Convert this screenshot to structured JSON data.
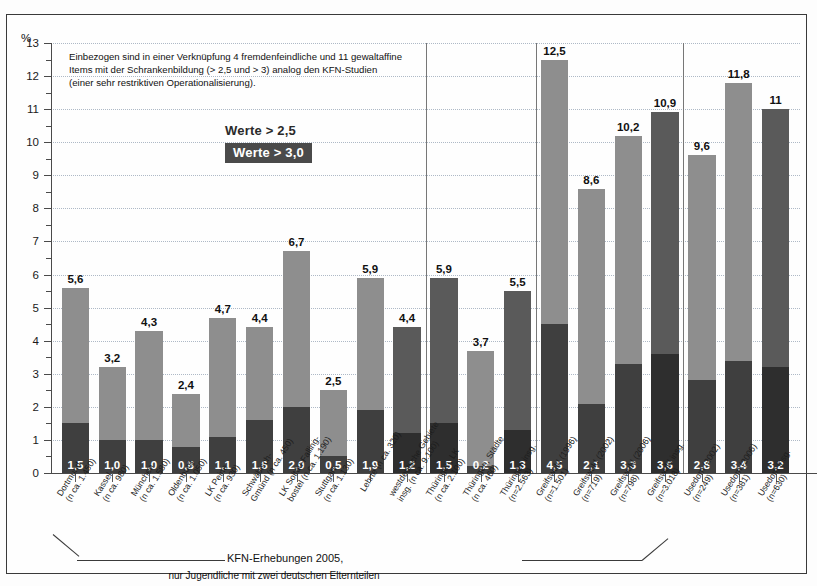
{
  "annotation": {
    "line1": "Einbezogen sind in einer Verknüpfung 4 fremdenfeindliche und 11 gewaltaffine",
    "line2": "Items mit der Schrankenbildung (> 2,5 und > 3) analog den KFN-Studien",
    "line3": "(einer sehr restriktiven Operationalisierung)."
  },
  "legend": {
    "light_label": "Werte > 2,5",
    "dark_label": "Werte > 3,0"
  },
  "caption": {
    "line1": "KFN-Erhebungen 2005,",
    "line2": "nur Jugendliche mit zwei deutschen Elternteilen"
  },
  "axis": {
    "y_unit": "%",
    "y_ticks": [
      "0",
      "1",
      "2",
      "3",
      "4",
      "5",
      "6",
      "7",
      "8",
      "9",
      "10",
      "11",
      "12",
      "13"
    ]
  },
  "chart_data": {
    "type": "bar",
    "title": "",
    "subtitle": "",
    "xlabel": "",
    "ylabel": "%",
    "ylim": [
      0,
      13
    ],
    "grid": true,
    "stacked": true,
    "legend_position": "inside-top-left",
    "series": [
      {
        "name": "Werte > 2,5",
        "values": [
          5.6,
          3.2,
          4.3,
          2.4,
          4.7,
          4.4,
          6.7,
          2.5,
          5.9,
          4.4,
          5.9,
          3.7,
          5.5,
          12.5,
          8.6,
          10.2,
          10.9,
          9.6,
          11.8,
          11.0
        ]
      },
      {
        "name": "Werte > 3,0",
        "values": [
          1.5,
          1.0,
          1.0,
          0.8,
          1.1,
          1.6,
          2.0,
          0.5,
          1.9,
          1.2,
          1.5,
          0.2,
          1.3,
          4.5,
          2.1,
          3.3,
          3.6,
          2.8,
          3.4,
          3.2
        ]
      }
    ],
    "categories": [
      "Dortmund (n ca. 1.450)",
      "Kassel (n ca. 980)",
      "München (n ca. 1.580)",
      "Oldenburg (n ca. 1.050)",
      "LK Peine (n ca. 930)",
      "Schwäbisch-Gmünd (n ca. 450)",
      "LK Soltau-Fallingbostel (n ca. 1.190)",
      "Stuttgart (n ca. 1.130)",
      "Lehrte (n ca. 320)",
      "westdeutsche Gebiete insg. (n ca. 9.100)",
      "Thüringen, LK (n ca. 2.100)",
      "Thüringen, Städte (n ca. 460)",
      "Thüringen insg. (n=2.563)",
      "Greifswald (1996) (n=1.501)",
      "Greifswald (2002) (n=719)",
      "Greifswald (2006) (n=798)",
      "Greifswald insg. (n=3.018)",
      "Usedom (2002) (n=249)",
      "Usedom (2006) (n=381)",
      "Usedom insg. (n=630)"
    ]
  },
  "bars": [
    {
      "label_l1": "Dortmund",
      "label_l2": "(n ca. 1.450)",
      "total": "5,6",
      "base": "1,5",
      "total_v": 5.6,
      "base_v": 1.5,
      "tone": "light"
    },
    {
      "label_l1": "Kassel",
      "label_l2": "(n ca. 980)",
      "total": "3,2",
      "base": "1,0",
      "total_v": 3.2,
      "base_v": 1.0,
      "tone": "light"
    },
    {
      "label_l1": "München",
      "label_l2": "(n ca. 1.580)",
      "total": "4,3",
      "base": "1,0",
      "total_v": 4.3,
      "base_v": 1.0,
      "tone": "light"
    },
    {
      "label_l1": "Oldenburg",
      "label_l2": "(n ca. 1.050)",
      "total": "2,4",
      "base": "0,8",
      "total_v": 2.4,
      "base_v": 0.8,
      "tone": "light"
    },
    {
      "label_l1": "LK Peine",
      "label_l2": "(n ca. 930)",
      "total": "4,7",
      "base": "1,1",
      "total_v": 4.7,
      "base_v": 1.1,
      "tone": "light"
    },
    {
      "label_l1": "Schwäbisch-",
      "label_l2": "Gmünd (n ca. 450)",
      "total": "4,4",
      "base": "1,6",
      "total_v": 4.4,
      "base_v": 1.6,
      "tone": "light"
    },
    {
      "label_l1": "LK Soltau-Falling-",
      "label_l2": "bostel (n ca. 1.190)",
      "total": "6,7",
      "base": "2,0",
      "total_v": 6.7,
      "base_v": 2.0,
      "tone": "light"
    },
    {
      "label_l1": "Stuttgart",
      "label_l2": "(n ca. 1.130)",
      "total": "2,5",
      "base": "0,5",
      "total_v": 2.5,
      "base_v": 0.5,
      "tone": "light"
    },
    {
      "label_l1": "Lehrte (n ca. 320)",
      "label_l2": "",
      "total": "5,9",
      "base": "1,9",
      "total_v": 5.9,
      "base_v": 1.9,
      "tone": "light"
    },
    {
      "label_l1": "westdeutsche Gebiete",
      "label_l2": "insg. (n ca. 9.100)",
      "total": "4,4",
      "base": "1,2",
      "total_v": 4.4,
      "base_v": 1.2,
      "tone": "dark"
    },
    {
      "label_l1": "Thüringen, LK",
      "label_l2": "(n ca. 2.100)",
      "total": "5,9",
      "base": "1,5",
      "total_v": 5.9,
      "base_v": 1.5,
      "tone": "dark"
    },
    {
      "label_l1": "Thüringen, Städte",
      "label_l2": "(n ca. 460)",
      "total": "3,7",
      "base": "0,2",
      "total_v": 3.7,
      "base_v": 0.2,
      "tone": "light"
    },
    {
      "label_l1": "Thüringen insg.",
      "label_l2": "(n=2.563)",
      "total": "5,5",
      "base": "1,3",
      "total_v": 5.5,
      "base_v": 1.3,
      "tone": "dark"
    },
    {
      "label_l1": "Greifswald (1996)",
      "label_l2": "(n=1.501)",
      "total": "12,5",
      "base": "4,5",
      "total_v": 12.5,
      "base_v": 4.5,
      "tone": "light"
    },
    {
      "label_l1": "Greifswald (2002)",
      "label_l2": "(n=719)",
      "total": "8,6",
      "base": "2,1",
      "total_v": 8.6,
      "base_v": 2.1,
      "tone": "light"
    },
    {
      "label_l1": "Greifswald (2006)",
      "label_l2": "(n=798)",
      "total": "10,2",
      "base": "3,3",
      "total_v": 10.2,
      "base_v": 3.3,
      "tone": "light"
    },
    {
      "label_l1": "Greifswald insg.",
      "label_l2": "(n=3.018)",
      "total": "10,9",
      "base": "3,6",
      "total_v": 10.9,
      "base_v": 3.6,
      "tone": "dark"
    },
    {
      "label_l1": "Usedom (2002)",
      "label_l2": "(n=249)",
      "total": "9,6",
      "base": "2,8",
      "total_v": 9.6,
      "base_v": 2.8,
      "tone": "light"
    },
    {
      "label_l1": "Usedom (2006)",
      "label_l2": "(n=381)",
      "total": "11,8",
      "base": "3,4",
      "total_v": 11.8,
      "base_v": 3.4,
      "tone": "light"
    },
    {
      "label_l1": "Usedom insg.",
      "label_l2": "(n=630)",
      "total": "11",
      "base": "3,2",
      "total_v": 11.0,
      "base_v": 3.2,
      "tone": "dark"
    }
  ],
  "colors": {
    "light": "#8e8e8e",
    "dark": "#5a5a5a",
    "base": "#3f3f3f",
    "base_dark": "#2e2e2e",
    "grid": "#b9c4cf",
    "axis": "#4a4a4a"
  },
  "separators_after_bar_index": [
    9,
    12,
    16
  ]
}
